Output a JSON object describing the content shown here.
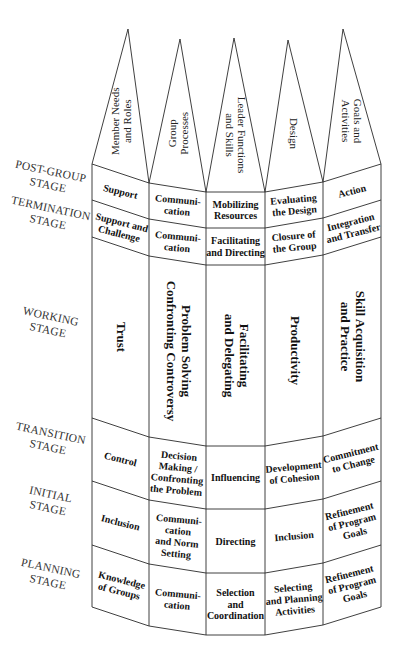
{
  "diagram": {
    "dimensions": [
      {
        "lines": [
          "Member Needs",
          "and Roles"
        ],
        "rotate": -90
      },
      {
        "lines": [
          "Group",
          "Processes"
        ],
        "rotate": -90
      },
      {
        "lines": [
          "Leader Functions",
          "and Skills"
        ],
        "rotate": 90
      },
      {
        "lines": [
          "Design"
        ],
        "rotate": 90
      },
      {
        "lines": [
          "Goals and",
          "Activities"
        ],
        "rotate": 90
      }
    ],
    "stages": [
      {
        "lines": [
          "POST-GROUP",
          "STAGE"
        ]
      },
      {
        "lines": [
          "TERMINATION",
          "STAGE"
        ]
      },
      {
        "lines": [
          "WORKING",
          "STAGE"
        ]
      },
      {
        "lines": [
          "TRANSITION",
          "STAGE"
        ]
      },
      {
        "lines": [
          "INITIAL",
          "STAGE"
        ]
      },
      {
        "lines": [
          "PLANNING",
          "STAGE"
        ]
      }
    ],
    "cells": [
      [
        [
          "Support"
        ],
        [
          "Communi-",
          "cation"
        ],
        [
          "Mobilizing",
          "Resources"
        ],
        [
          "Evaluating",
          "the Design"
        ],
        [
          "Action"
        ]
      ],
      [
        [
          "Support and",
          "Challenge"
        ],
        [
          "Communi-",
          "cation"
        ],
        [
          "Facilitating",
          "and Directing"
        ],
        [
          "Closure of",
          "the Group"
        ],
        [
          "Integration",
          "and Transfer"
        ]
      ],
      [
        [
          "Trust"
        ],
        [
          "Problem Solving",
          "Confronting Controversy"
        ],
        [
          "Facilitating",
          "and Delegating"
        ],
        [
          "Productivity"
        ],
        [
          "Skill Acquisition",
          "and Practice"
        ]
      ],
      [
        [
          "Control"
        ],
        [
          "Decision",
          "Making /",
          "Confronting",
          "the Problem"
        ],
        [
          "Influencing"
        ],
        [
          "Development",
          "of Cohesion"
        ],
        [
          "Commitment",
          "to Change"
        ]
      ],
      [
        [
          "Inclusion"
        ],
        [
          "Communi-",
          "cation",
          "and Norm",
          "Setting"
        ],
        [
          "Directing"
        ],
        [
          "Inclusion"
        ],
        [
          "Refinement",
          "of Program",
          "Goals"
        ]
      ],
      [
        [
          "Knowledge",
          "of Groups"
        ],
        [
          "Communi-",
          "cation"
        ],
        [
          "Selection",
          "and",
          "Coordination"
        ],
        [
          "Selecting",
          "and Planning",
          "Activities"
        ],
        [
          "Refinement",
          "of Program",
          "Goals"
        ]
      ]
    ]
  }
}
